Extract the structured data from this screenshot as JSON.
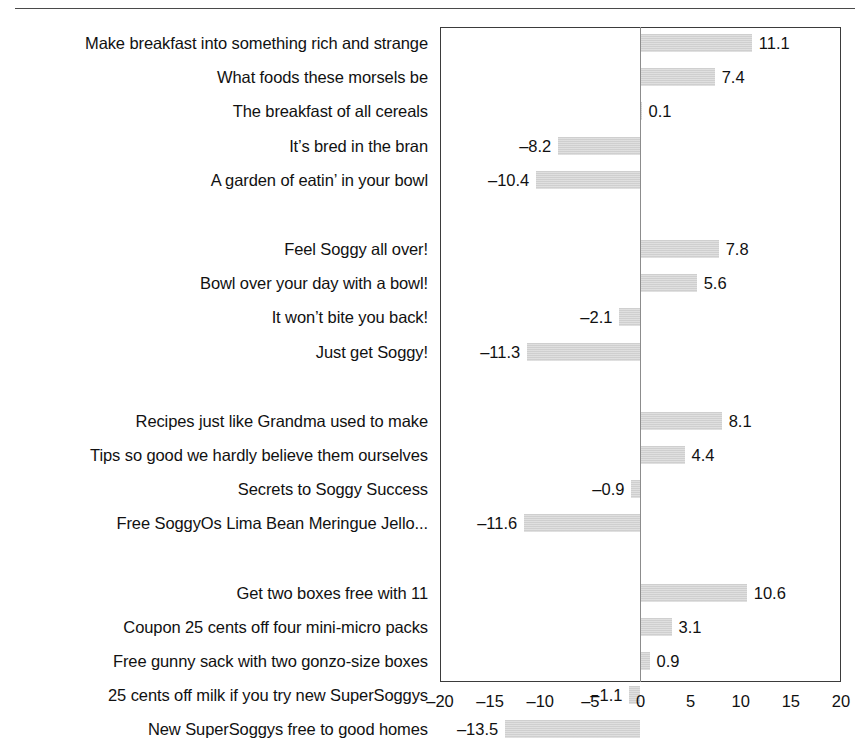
{
  "chart_data": {
    "type": "bar",
    "orientation": "horizontal",
    "title": "",
    "subtitle": "",
    "xlabel": "",
    "ylabel": "",
    "xlim": [
      -20,
      20
    ],
    "xticks": [
      "–20",
      "–15",
      "–10",
      "–5",
      "0",
      "5",
      "10",
      "15",
      "20"
    ],
    "xtick_values": [
      -20,
      -15,
      -10,
      -5,
      0,
      5,
      10,
      15,
      20
    ],
    "grid": false,
    "legend": null,
    "bar_color": "#d2d2d2",
    "zero_line_color": "#8c8c8c",
    "frame_color": "#3b3b3b",
    "groups": [
      {
        "name": "group-1",
        "categories": [
          "Make breakfast into something rich and strange",
          "What foods these morsels be",
          "The breakfast of all cereals",
          "It’s bred in the bran",
          "A garden of eatin’ in your bowl"
        ],
        "values": [
          11.1,
          7.4,
          0.1,
          -8.2,
          -10.4
        ],
        "labels": [
          "11.1",
          "7.4",
          "0.1",
          "–8.2",
          "–10.4"
        ]
      },
      {
        "name": "group-2",
        "categories": [
          "Feel Soggy all over!",
          "Bowl over your day with a bowl!",
          "It won’t bite you back!",
          "Just get Soggy!"
        ],
        "values": [
          7.8,
          5.6,
          -2.1,
          -11.3
        ],
        "labels": [
          "7.8",
          "5.6",
          "–2.1",
          "–11.3"
        ]
      },
      {
        "name": "group-3",
        "categories": [
          "Recipes just like Grandma used to make",
          "Tips so good we hardly believe them ourselves",
          "Secrets to Soggy Success",
          "Free SoggyOs Lima Bean Meringue Jello..."
        ],
        "values": [
          8.1,
          4.4,
          -0.9,
          -11.6
        ],
        "labels": [
          "8.1",
          "4.4",
          "–0.9",
          "–11.6"
        ]
      },
      {
        "name": "group-4",
        "categories": [
          "Get two boxes free with 11",
          "Coupon 25 cents off four mini-micro packs",
          "Free gunny sack with two gonzo-size boxes",
          "25 cents off milk if you try new SuperSoggys",
          "New SuperSoggys free to good homes"
        ],
        "values": [
          10.6,
          3.1,
          0.9,
          -1.1,
          -13.5
        ],
        "labels": [
          "10.6",
          "3.1",
          "0.9",
          "–1.1",
          "–13.5"
        ]
      }
    ]
  }
}
